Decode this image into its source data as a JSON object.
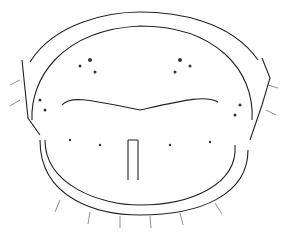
{
  "figure": {
    "background": "#ffffff",
    "ink": "#1a1a1a"
  }
}
